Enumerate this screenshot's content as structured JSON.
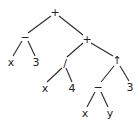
{
  "diagram": {
    "type": "expression-tree",
    "nodes": [
      {
        "id": "n0",
        "label": "+",
        "x": 55,
        "y": 12
      },
      {
        "id": "n1",
        "label": "−",
        "x": 25,
        "y": 37
      },
      {
        "id": "n2",
        "label": "x",
        "x": 11,
        "y": 62
      },
      {
        "id": "n3",
        "label": "3",
        "x": 36,
        "y": 62
      },
      {
        "id": "n4",
        "label": "+",
        "x": 87,
        "y": 39
      },
      {
        "id": "n5",
        "label": "/",
        "x": 65,
        "y": 63
      },
      {
        "id": "n6",
        "label": "x",
        "x": 45,
        "y": 88
      },
      {
        "id": "n7",
        "label": "4",
        "x": 72,
        "y": 88
      },
      {
        "id": "n8",
        "label": "↑",
        "x": 117,
        "y": 60
      },
      {
        "id": "n9",
        "label": "−",
        "x": 98,
        "y": 87
      },
      {
        "id": "n10",
        "label": "3",
        "x": 130,
        "y": 87
      },
      {
        "id": "n11",
        "label": "x",
        "x": 85,
        "y": 113
      },
      {
        "id": "n12",
        "label": "y",
        "x": 110,
        "y": 113
      }
    ],
    "edges": [
      {
        "from": "n0",
        "to": "n1",
        "x1": 51,
        "y1": 16,
        "x2": 28,
        "y2": 33
      },
      {
        "from": "n0",
        "to": "n4",
        "x1": 59,
        "y1": 16,
        "x2": 83,
        "y2": 35
      },
      {
        "from": "n1",
        "to": "n2",
        "x1": 22,
        "y1": 41,
        "x2": 13,
        "y2": 56
      },
      {
        "from": "n1",
        "to": "n3",
        "x1": 28,
        "y1": 41,
        "x2": 35,
        "y2": 56
      },
      {
        "from": "n4",
        "to": "n5",
        "x1": 83,
        "y1": 43,
        "x2": 67,
        "y2": 57
      },
      {
        "from": "n4",
        "to": "n8",
        "x1": 91,
        "y1": 43,
        "x2": 113,
        "y2": 56
      },
      {
        "from": "n5",
        "to": "n6",
        "x1": 62,
        "y1": 68,
        "x2": 47,
        "y2": 82
      },
      {
        "from": "n5",
        "to": "n7",
        "x1": 66,
        "y1": 68,
        "x2": 72,
        "y2": 82
      },
      {
        "from": "n8",
        "to": "n9",
        "x1": 114,
        "y1": 66,
        "x2": 101,
        "y2": 82
      },
      {
        "from": "n8",
        "to": "n10",
        "x1": 120,
        "y1": 66,
        "x2": 129,
        "y2": 81
      },
      {
        "from": "n9",
        "to": "n11",
        "x1": 95,
        "y1": 92,
        "x2": 87,
        "y2": 107
      },
      {
        "from": "n9",
        "to": "n12",
        "x1": 101,
        "y1": 92,
        "x2": 108,
        "y2": 107
      }
    ]
  }
}
